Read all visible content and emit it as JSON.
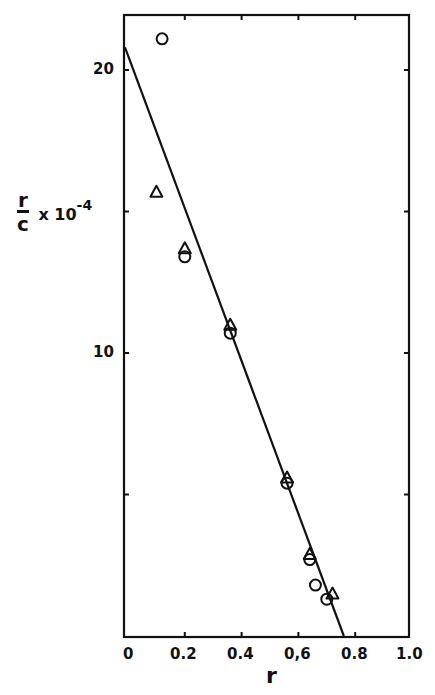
{
  "chart_data": {
    "type": "scatter",
    "title": "",
    "xlabel": "r",
    "ylabel": "r/c × 10^-4",
    "ylabel_parts": {
      "numerator": "r",
      "denominator": "c",
      "multiplier": "x 10",
      "exponent": "-4"
    },
    "xlim": [
      0,
      1.0
    ],
    "ylim": [
      0,
      22
    ],
    "grid": false,
    "legend": null,
    "x_ticks": [
      0,
      0.2,
      0.4,
      0.6,
      0.8,
      1.0
    ],
    "x_tick_labels": [
      "0",
      "0.2",
      "0.4",
      "0,6",
      "0.8",
      "1.0"
    ],
    "y_ticks": [
      5,
      10,
      15,
      20
    ],
    "y_tick_labels": [
      "",
      "10",
      "",
      "20"
    ],
    "series": [
      {
        "name": "circles",
        "marker": "circle",
        "points": [
          {
            "x": 0.12,
            "y": 21.1
          },
          {
            "x": 0.2,
            "y": 13.4
          },
          {
            "x": 0.36,
            "y": 10.7
          },
          {
            "x": 0.56,
            "y": 5.4
          },
          {
            "x": 0.64,
            "y": 2.7
          },
          {
            "x": 0.66,
            "y": 1.8
          },
          {
            "x": 0.7,
            "y": 1.3
          }
        ]
      },
      {
        "name": "triangles",
        "marker": "triangle",
        "points": [
          {
            "x": 0.1,
            "y": 15.7
          },
          {
            "x": 0.2,
            "y": 13.7
          },
          {
            "x": 0.36,
            "y": 11.0
          },
          {
            "x": 0.56,
            "y": 5.6
          },
          {
            "x": 0.64,
            "y": 2.9
          },
          {
            "x": 0.72,
            "y": 1.5
          }
        ]
      },
      {
        "name": "fit-line",
        "type": "line",
        "points": [
          {
            "x": 0.0,
            "y": 20.8
          },
          {
            "x": 0.76,
            "y": 0.0
          }
        ]
      }
    ]
  },
  "labels": {
    "x_axis": "r",
    "y_num": "r",
    "y_den": "c",
    "y_mult": "x 10",
    "y_exp": "-4",
    "x_ticks": [
      "0",
      "0.2",
      "0.4",
      "0,6",
      "0.8",
      "1.0"
    ],
    "y_tick_20": "20",
    "y_tick_10": "10"
  }
}
